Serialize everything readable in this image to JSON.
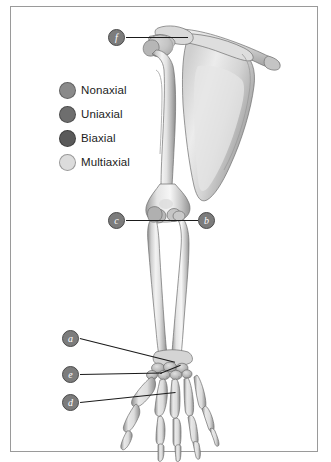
{
  "figure": {
    "background_color": "#ffffff",
    "border_color": "#9a9a9a"
  },
  "legend": {
    "items": [
      {
        "label": "Nonaxial",
        "color": "#8a8a8a"
      },
      {
        "label": "Uniaxial",
        "color": "#6e6e6e"
      },
      {
        "label": "Biaxial",
        "color": "#5a5a5a"
      },
      {
        "label": "Multiaxial",
        "color": "#dcdcdc"
      }
    ]
  },
  "callouts": [
    {
      "id": "marker-f",
      "label": "f",
      "x": 108,
      "y": 29,
      "line": {
        "x": 126,
        "y": 37,
        "length": 62,
        "angle": 0
      }
    },
    {
      "id": "marker-c",
      "label": "c",
      "x": 108,
      "y": 212,
      "line": {
        "x": 126,
        "y": 220,
        "length": 46,
        "angle": 0
      }
    },
    {
      "id": "marker-b",
      "label": "b",
      "x": 198,
      "y": 212,
      "line": {
        "x": 198,
        "y": 220,
        "length": 26,
        "angle": 180
      }
    },
    {
      "id": "marker-a",
      "label": "a",
      "x": 62,
      "y": 330,
      "line": {
        "x": 80,
        "y": 338,
        "length": 98,
        "angle": 14
      }
    },
    {
      "id": "marker-e",
      "label": "e",
      "x": 62,
      "y": 366,
      "line": {
        "x": 80,
        "y": 374,
        "length": 82,
        "angle": -14
      }
    },
    {
      "id": "marker-d",
      "label": "d",
      "x": 62,
      "y": 394,
      "line": {
        "x": 80,
        "y": 402,
        "length": 96,
        "angle": -6
      }
    }
  ],
  "anatomy": {
    "regions": [
      "scapula",
      "clavicle",
      "humerus",
      "radius",
      "ulna",
      "carpals",
      "metacarpals",
      "phalanges"
    ]
  }
}
